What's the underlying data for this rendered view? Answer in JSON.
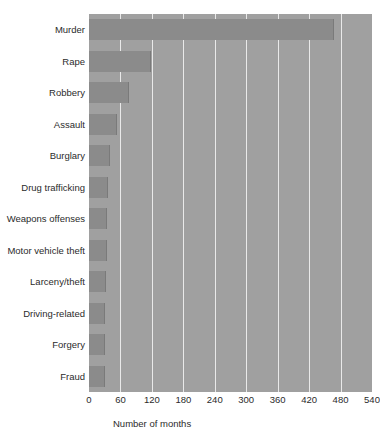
{
  "chart_data": {
    "type": "bar",
    "orientation": "horizontal",
    "title": "",
    "xlabel": "Number of months",
    "ylabel": "",
    "xlim": [
      0,
      540
    ],
    "xticks": [
      0,
      60,
      120,
      180,
      240,
      300,
      360,
      420,
      480,
      540
    ],
    "grid": "vertical",
    "legend": "none",
    "categories": [
      "Murder",
      "Rape",
      "Robbery",
      "Assault",
      "Burglary",
      "Drug trafficking",
      "Weapons offenses",
      "Motor vehicle theft",
      "Larceny/theft",
      "Driving-related",
      "Forgery",
      "Fraud"
    ],
    "values": [
      467,
      118,
      77,
      54,
      40,
      36,
      35,
      34,
      33,
      31,
      30,
      30
    ],
    "colors": {
      "bar_fill": "#8b8b8b",
      "plot_background": "#a0a0a0",
      "gridline": "#e9e9e9",
      "page_background": "#ffffff",
      "text": "#2b2b2b"
    }
  }
}
